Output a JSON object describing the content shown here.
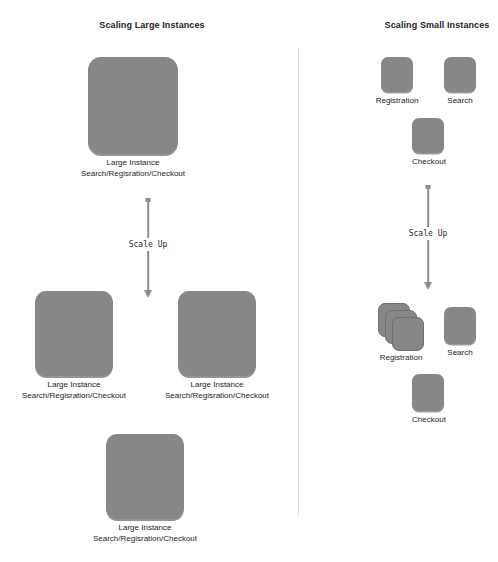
{
  "diagram": {
    "background_color": "#ffffff",
    "box_color": "#878787",
    "arrow_color": "#8c8c8c",
    "divider_color": "#d9d9d9",
    "text_color": "#1d1d1d"
  },
  "left_panel": {
    "title": "Scaling Large Instances",
    "before": {
      "instances": [
        {
          "caption_line1": "Large Instance",
          "caption_line2": "Search/Regisration/Checkout"
        }
      ]
    },
    "arrow": {
      "label": "Scale Up"
    },
    "after": {
      "instances": [
        {
          "caption_line1": "Large Instance",
          "caption_line2": "Search/Regisration/Checkout"
        },
        {
          "caption_line1": "Large Instance",
          "caption_line2": "Search/Regisration/Checkout"
        },
        {
          "caption_line1": "Large Instance",
          "caption_line2": "Search/Regisration/Checkout"
        }
      ]
    }
  },
  "right_panel": {
    "title": "Scaling Small Instances",
    "before": {
      "services": [
        {
          "label": "Registration",
          "count": 1
        },
        {
          "label": "Search",
          "count": 1
        },
        {
          "label": "Checkout",
          "count": 1
        }
      ]
    },
    "arrow": {
      "label": "Scale Up"
    },
    "after": {
      "services": [
        {
          "label": "Registration",
          "count": 3
        },
        {
          "label": "Search",
          "count": 1
        },
        {
          "label": "Checkout",
          "count": 1
        }
      ]
    }
  }
}
